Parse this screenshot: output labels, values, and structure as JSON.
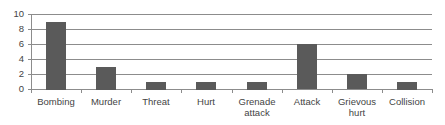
{
  "chart_data": {
    "type": "bar",
    "title": "",
    "xlabel": "",
    "ylabel": "",
    "categories": [
      "Bombing",
      "Murder",
      "Threat",
      "Hurt",
      "Grenade attack",
      "Attack",
      "Grievous hurt",
      "Collision"
    ],
    "category_lines": [
      [
        "Bombing"
      ],
      [
        "Murder"
      ],
      [
        "Threat"
      ],
      [
        "Hurt"
      ],
      [
        "Grenade",
        "attack"
      ],
      [
        "Attack"
      ],
      [
        "Grievous",
        "hurt"
      ],
      [
        "Collision"
      ]
    ],
    "values": [
      9,
      3,
      1,
      1,
      1,
      6,
      2,
      1
    ],
    "ylim": [
      0,
      10
    ],
    "yticks": [
      0,
      2,
      4,
      6,
      8,
      10
    ],
    "grid": true,
    "legend": null,
    "bar_color": "#5a5a5a",
    "grid_color": "#8c8c8c"
  }
}
